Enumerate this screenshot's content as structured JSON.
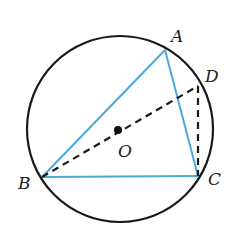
{
  "diagram": {
    "type": "circle-geometry",
    "circle": {
      "center": [
        120,
        129
      ],
      "radius": 93,
      "stroke": "#1a1a1a"
    },
    "colors": {
      "triangle": "#4da6dc",
      "dashed": "#1a1a1a",
      "circle": "#1a1a1a"
    },
    "points": {
      "A": {
        "label": "A",
        "x": 165,
        "y": 50
      },
      "B": {
        "label": "B",
        "x": 42,
        "y": 177
      },
      "C": {
        "label": "C",
        "x": 198,
        "y": 176
      },
      "D": {
        "label": "D",
        "x": 198,
        "y": 86
      },
      "O": {
        "label": "O",
        "x": 118,
        "y": 130
      }
    },
    "segments": {
      "solid": [
        "AB",
        "BC",
        "CA"
      ],
      "dashed": [
        "BD",
        "DC"
      ]
    }
  }
}
